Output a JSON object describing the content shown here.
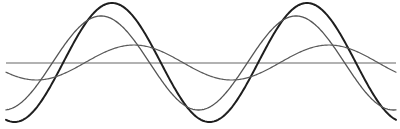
{
  "diagram": {
    "width": 400,
    "height": 129,
    "x_start": 6,
    "x_end": 396,
    "baseline": {
      "y": 63,
      "color": "#666666",
      "stroke_width": 1.2
    },
    "waves": [
      {
        "name": "large-wave",
        "center_y": 62.5,
        "amplitude": 59.5,
        "period": 195,
        "peak_x": 112,
        "color": "#1e1e1e",
        "stroke_width": 2.0
      },
      {
        "name": "medium-wave",
        "center_y": 63,
        "amplitude": 47,
        "period": 195,
        "peak_x": 101,
        "color": "#555555",
        "stroke_width": 1.3
      },
      {
        "name": "small-wave",
        "center_y": 62.5,
        "amplitude": 17.5,
        "period": 195,
        "peak_x": 134,
        "color": "#5a5a5a",
        "stroke_width": 1.2
      }
    ]
  }
}
